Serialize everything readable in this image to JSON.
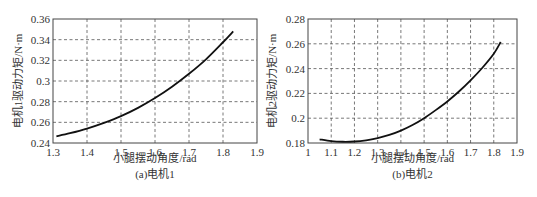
{
  "chart_data": [
    {
      "type": "line",
      "caption": "(a)电机1",
      "xlabel": "小腿摆动角度/rad",
      "ylabel": "电机1驱动力矩/N·m",
      "xlim": [
        1.3,
        1.9
      ],
      "ylim": [
        0.24,
        0.36
      ],
      "xticks": [
        1.3,
        1.4,
        1.5,
        1.6,
        1.7,
        1.8,
        1.9
      ],
      "xtick_labels": [
        "1.3",
        "1.4",
        "1.5",
        "1.6",
        "1.7",
        "1.8",
        "1.9"
      ],
      "yticks": [
        0.24,
        0.26,
        0.28,
        0.3,
        0.32,
        0.34,
        0.36
      ],
      "ytick_labels": [
        "0.24",
        "0.26",
        "0.28",
        "0.3",
        "0.32",
        "0.34",
        "0.36"
      ],
      "grid": true,
      "series": [
        {
          "name": "电机1",
          "x": [
            1.31,
            1.35,
            1.4,
            1.45,
            1.5,
            1.55,
            1.6,
            1.65,
            1.7,
            1.75,
            1.8,
            1.83
          ],
          "y": [
            0.2465,
            0.2495,
            0.254,
            0.2595,
            0.266,
            0.274,
            0.2835,
            0.2945,
            0.307,
            0.321,
            0.3375,
            0.348
          ]
        }
      ]
    },
    {
      "type": "line",
      "caption": "(b)电机2",
      "xlabel": "小腿摆动角度/rad",
      "ylabel": "电机2驱动力矩/N·m",
      "xlim": [
        1.0,
        1.9
      ],
      "ylim": [
        0.18,
        0.28
      ],
      "xticks": [
        1.0,
        1.1,
        1.2,
        1.3,
        1.4,
        1.5,
        1.6,
        1.7,
        1.8,
        1.9
      ],
      "xtick_labels": [
        "1",
        "1.1",
        "1.2",
        "1.3",
        "1.4",
        "1.5",
        "1.6",
        "1.7",
        "1.8",
        "1.9"
      ],
      "yticks": [
        0.18,
        0.2,
        0.22,
        0.24,
        0.26,
        0.28
      ],
      "ytick_labels": [
        "0.18",
        "0.2",
        "0.22",
        "0.24",
        "0.26",
        "0.28"
      ],
      "grid": true,
      "series": [
        {
          "name": "电机2",
          "x": [
            1.05,
            1.1,
            1.15,
            1.2,
            1.25,
            1.3,
            1.35,
            1.4,
            1.45,
            1.5,
            1.55,
            1.6,
            1.65,
            1.7,
            1.75,
            1.8,
            1.83
          ],
          "y": [
            0.183,
            0.1815,
            0.181,
            0.1812,
            0.1822,
            0.184,
            0.1865,
            0.19,
            0.1945,
            0.2,
            0.2065,
            0.2135,
            0.2215,
            0.2305,
            0.2405,
            0.252,
            0.2615
          ]
        }
      ]
    }
  ]
}
